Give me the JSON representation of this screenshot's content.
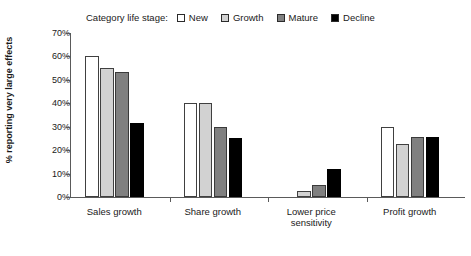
{
  "legend": {
    "title": "Category life stage:",
    "items": [
      {
        "label": "New",
        "color": "#ffffff",
        "key": "new"
      },
      {
        "label": "Growth",
        "color": "#d2d2d2",
        "key": "growth"
      },
      {
        "label": "Mature",
        "color": "#808080",
        "key": "mature"
      },
      {
        "label": "Decline",
        "color": "#000000",
        "key": "decline"
      }
    ]
  },
  "axes": {
    "y_title": "% reporting very large effects",
    "y_ticks": [
      "0%",
      "10%",
      "20%",
      "30%",
      "40%",
      "50%",
      "60%",
      "70%"
    ]
  },
  "chart_data": {
    "type": "bar",
    "title": "",
    "xlabel": "",
    "ylabel": "% reporting very large effects",
    "ylim": [
      0,
      70
    ],
    "ytick_values": [
      0,
      10,
      20,
      30,
      40,
      50,
      60,
      70
    ],
    "ytick_labels": [
      "0%",
      "10%",
      "20%",
      "30%",
      "40%",
      "50%",
      "60%",
      "70%"
    ],
    "grid": false,
    "legend_position": "top",
    "categories": [
      "Sales growth",
      "Share growth",
      "Lower price sensitivity",
      "Profit growth"
    ],
    "category_lines": [
      [
        "Sales growth"
      ],
      [
        "Share growth"
      ],
      [
        "Lower price",
        "sensitivity"
      ],
      [
        "Profit growth"
      ]
    ],
    "series": [
      {
        "name": "New",
        "color": "#ffffff",
        "values": [
          60.0,
          40.0,
          0.0,
          30.0
        ]
      },
      {
        "name": "Growth",
        "color": "#d2d2d2",
        "values": [
          55.0,
          40.0,
          2.5,
          22.5
        ]
      },
      {
        "name": "Mature",
        "color": "#808080",
        "values": [
          53.5,
          30.0,
          5.0,
          25.5
        ]
      },
      {
        "name": "Decline",
        "color": "#000000",
        "values": [
          31.5,
          25.0,
          12.0,
          25.5
        ]
      }
    ]
  }
}
